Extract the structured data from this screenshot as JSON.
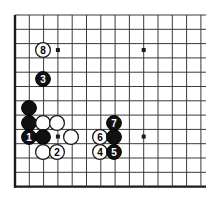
{
  "figure": {
    "kind": "go-board-diagram",
    "board": {
      "background_color": "#ffffff",
      "line_color": "#3a3a3a",
      "border_color": "#1a1a1a",
      "origin_x": 15,
      "origin_y": 15,
      "cell_size": 14.3,
      "cols": 13,
      "rows": 12,
      "left_edge_thick": true,
      "bottom_edge_thick": true,
      "star_points": [
        {
          "name": "star-point-left",
          "col": 3,
          "row": 2.45
        },
        {
          "name": "star-point-right",
          "col": 9,
          "row": 2.45
        },
        {
          "name": "star-point-center",
          "col": 9,
          "row": 8.5
        },
        {
          "name": "star-point-lower-left",
          "col": 3,
          "row": 8.5
        }
      ]
    },
    "stones": [
      {
        "id": "stone-move-8",
        "color": "white",
        "label": "8",
        "cx": 43,
        "cy": 50
      },
      {
        "id": "stone-move-3",
        "color": "black",
        "label": "3",
        "cx": 43,
        "cy": 79
      },
      {
        "id": "stone-black-a",
        "color": "black",
        "label": "",
        "cx": 29,
        "cy": 108
      },
      {
        "id": "stone-black-b",
        "color": "black",
        "label": "",
        "cx": 29,
        "cy": 123
      },
      {
        "id": "stone-white-a",
        "color": "white",
        "label": "",
        "cx": 43,
        "cy": 123
      },
      {
        "id": "stone-white-b",
        "color": "white",
        "label": "",
        "cx": 57,
        "cy": 123
      },
      {
        "id": "stone-move-1",
        "color": "black",
        "label": "1",
        "cx": 29,
        "cy": 137
      },
      {
        "id": "stone-black-c",
        "color": "black",
        "label": "",
        "cx": 43,
        "cy": 137
      },
      {
        "id": "stone-white-c",
        "color": "white",
        "label": "",
        "cx": 71,
        "cy": 137
      },
      {
        "id": "stone-white-d",
        "color": "white",
        "label": "",
        "cx": 43,
        "cy": 152
      },
      {
        "id": "stone-move-2",
        "color": "white",
        "label": "2",
        "cx": 57,
        "cy": 152
      },
      {
        "id": "stone-move-7",
        "color": "black",
        "label": "7",
        "cx": 114,
        "cy": 123
      },
      {
        "id": "stone-move-6",
        "color": "white",
        "label": "6",
        "cx": 100,
        "cy": 137
      },
      {
        "id": "stone-black-d",
        "color": "black",
        "label": "",
        "cx": 114,
        "cy": 137
      },
      {
        "id": "stone-move-4",
        "color": "white",
        "label": "4",
        "cx": 100,
        "cy": 152
      },
      {
        "id": "stone-move-5",
        "color": "black",
        "label": "5",
        "cx": 114,
        "cy": 152
      }
    ],
    "stone_style": {
      "radius": 7.4,
      "black_fill": "#111111",
      "black_stroke": "#000000",
      "white_fill": "#ffffff",
      "white_stroke": "#1a1a1a",
      "label_font_size": "10px"
    },
    "move_order": [
      "1",
      "2",
      "3",
      "4",
      "5",
      "6",
      "7",
      "8"
    ]
  }
}
